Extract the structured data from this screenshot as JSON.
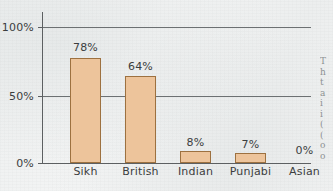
{
  "chart_data": {
    "type": "bar",
    "title": "",
    "subtitle": "",
    "xlabel": "",
    "ylabel": "",
    "categories": [
      "Sikh",
      "British",
      "Indian",
      "Punjabi",
      "Asian"
    ],
    "values": [
      78,
      64,
      8,
      7,
      0
    ],
    "value_labels": [
      "78%",
      "64%",
      "8%",
      "7%",
      "0%"
    ],
    "ylim": [
      0,
      100
    ],
    "yticks": [
      0,
      50,
      100
    ],
    "ytick_labels": [
      "0%",
      "50%",
      "100%"
    ],
    "grid": true,
    "grid_axis": "y",
    "legend": false,
    "legend_position": "none",
    "series": [
      {
        "name": "",
        "values": [
          78,
          64,
          8,
          7,
          0
        ]
      }
    ],
    "colors": {
      "bar_fill": "#edc49b",
      "bar_border": "#9d7140",
      "axis": "#5c5f61",
      "gridline": "#6c7072",
      "text": "#3b3d3e",
      "background": "#f1f2f2"
    }
  },
  "axis": {
    "y_labels": {
      "top": "100%",
      "mid": "50%",
      "bottom": "0%"
    }
  },
  "bars": [
    {
      "category": "Sikh",
      "value_label": "78%"
    },
    {
      "category": "British",
      "value_label": "64%"
    },
    {
      "category": "Indian",
      "value_label": "8%"
    },
    {
      "category": "Punjabi",
      "value_label": "7%"
    },
    {
      "category": "Asian",
      "value_label": "0%"
    }
  ],
  "margin_text": {
    "lines": [
      "T",
      "h",
      "t",
      "a",
      "i",
      "i",
      "(",
      "(",
      "o",
      "o"
    ]
  }
}
